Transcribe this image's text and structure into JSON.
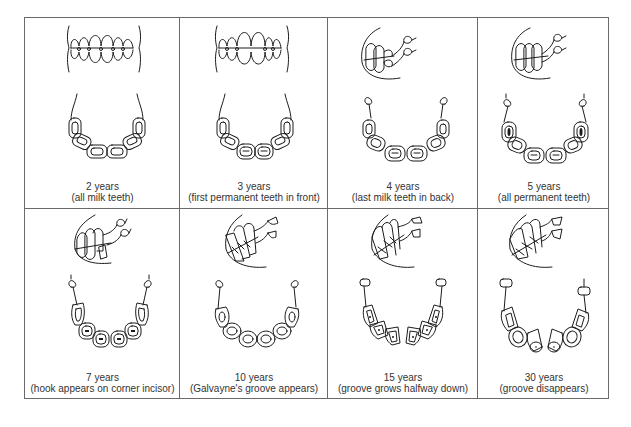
{
  "figure": {
    "title": "",
    "stages": [
      {
        "age": "2 years",
        "description": "(all milk teeth)",
        "view": "front"
      },
      {
        "age": "3 years",
        "description": "(first permanent teeth in front)",
        "view": "front"
      },
      {
        "age": "4 years",
        "description": "(last milk teeth in back)",
        "view": "side"
      },
      {
        "age": "5 years",
        "description": "(all permanent teeth)",
        "view": "side"
      },
      {
        "age": "7 years",
        "description": "(hook appears on corner incisor)",
        "view": "side"
      },
      {
        "age": "10 years",
        "description": "(Galvayne's groove appears)",
        "view": "side"
      },
      {
        "age": "15 years",
        "description": "(groove grows halfway down)",
        "view": "side"
      },
      {
        "age": "30 years",
        "description": "(groove disappears)",
        "view": "side"
      }
    ]
  },
  "colors": {
    "line": "#1c1c1c",
    "border": "#6a6a6a",
    "background": "#ffffff",
    "text": "#333333"
  }
}
